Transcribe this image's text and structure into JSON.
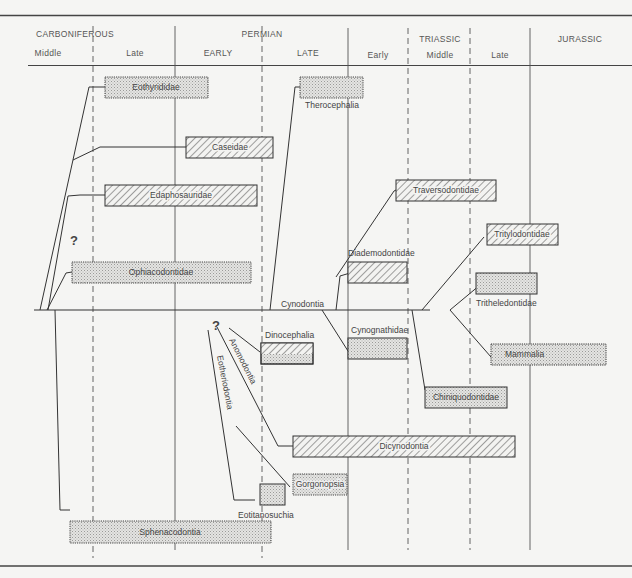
{
  "header": {
    "periods": [
      {
        "name": "CARBONIFEROUS",
        "x": 75
      },
      {
        "name": "PERMIAN",
        "x": 262
      },
      {
        "name": "TRIASSIC",
        "x": 440
      },
      {
        "name": "JURASSIC",
        "x": 580
      }
    ],
    "epochs": [
      {
        "name": "Middle",
        "x": 48
      },
      {
        "name": "Late",
        "x": 135
      },
      {
        "name": "EARLY",
        "x": 218
      },
      {
        "name": "LATE",
        "x": 308
      },
      {
        "name": "Early",
        "x": 378
      },
      {
        "name": "Middle",
        "x": 440
      },
      {
        "name": "Late",
        "x": 500
      }
    ]
  },
  "taxa": {
    "eothyrididae": "Eothyrididae",
    "caseidae": "Caseidae",
    "edaphosauridae": "Edaphosauridae",
    "ophiacodontidae": "Ophiacodontidae",
    "sphenacodontia": "Sphenacodontia",
    "therocephalia": "Therocephalia",
    "cynodontia": "Cynodontia",
    "diademodontidae": "Diademodontidae",
    "cynognathidae": "Cynognathidae",
    "traversodontidae": "Traversodontidae",
    "tritylodontidae": "Tritylodontidae",
    "tritheledontidae": "Tritheledontidae",
    "mammalia": "Mammalia",
    "chiniquodontidae": "Chiniquodontidae",
    "dinocephalia": "Dinocephalia",
    "anomodontia": "Anomodontia",
    "eotheriodontia": "Eotheriodontia",
    "dicynodontia": "Dicynodontia",
    "gorgonopsia": "Gorgonopsia",
    "eotitanosuchia": "Eotitanosuchia"
  },
  "uncertainty_marks": [
    "?",
    "?"
  ]
}
